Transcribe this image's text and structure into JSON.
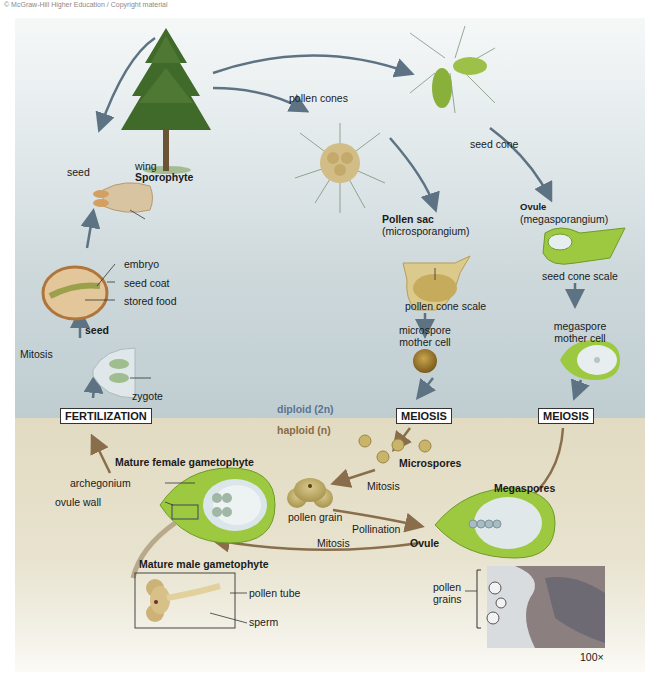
{
  "copyright": "© McGraw-Hill Higher Education / Copyright material",
  "colors": {
    "diploid_bg": "#c3d0d4",
    "haploid_bg": "#e3dcc4",
    "diploid_arrow": "#5d7283",
    "haploid_arrow": "#8a6e4b",
    "green_tissue": "#8fbf4a",
    "pollen_tan": "#c8b46a"
  },
  "zones": {
    "diploid": "diploid (2n)",
    "haploid": "haploid (n)"
  },
  "sporophyte": {
    "title": "Sporophyte"
  },
  "cones": {
    "pollen_cones": "pollen cones",
    "seed_cone": "seed cone"
  },
  "pollen_sac": {
    "title": "Pollen sac",
    "subtitle": "(microsporangium)",
    "scale": "pollen cone scale"
  },
  "ovule_top": {
    "title": "Ovule",
    "subtitle": "(megasporangium)",
    "scale": "seed cone scale"
  },
  "mother_cells": {
    "microspore": [
      "microspore",
      "mother cell"
    ],
    "megaspore": [
      "megaspore",
      "mother cell"
    ]
  },
  "process_boxes": {
    "fertilization": "FERTILIZATION",
    "meiosis_left": "MEIOSIS",
    "meiosis_right": "MEIOSIS"
  },
  "seed_stage": {
    "seed": "seed",
    "wing": "wing",
    "embryo": "embryo",
    "seed_coat": "seed coat",
    "stored_food": "stored food",
    "seed_bold": "seed",
    "mitosis": "Mitosis",
    "zygote": "zygote"
  },
  "haploid_stage": {
    "microspores": "Microspores",
    "mitosis_upper": "Mitosis",
    "pollen_grain": "pollen grain",
    "pollination": "Pollination",
    "megaspores": "Megaspores",
    "ovule": "Ovule",
    "mitosis_lower": "Mitosis",
    "female_title": "Mature female gametophyte",
    "archegonium": "archegonium",
    "ovule_wall": "ovule wall",
    "male_title": "Mature male gametophyte",
    "pollen_tube": "pollen tube",
    "sperm": "sperm"
  },
  "micrograph": {
    "label": [
      "pollen",
      "grains"
    ],
    "magnification": "100×"
  }
}
